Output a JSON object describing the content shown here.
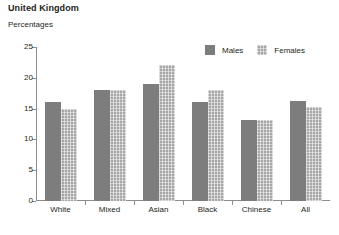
{
  "header": {
    "title": "United Kingdom",
    "subtitle": "Percentages"
  },
  "legend": {
    "position": "top-right",
    "entries": [
      {
        "label": "Males",
        "color": "#7d7d7d",
        "swatch": "males-swatch"
      },
      {
        "label": "Females",
        "color": "#a6a6a6",
        "swatch": "females-swatch"
      }
    ]
  },
  "axis": {
    "y_ticks": [
      "0",
      "5",
      "10",
      "15",
      "20",
      "25"
    ],
    "x_categories": [
      "White",
      "Mixed",
      "Asian",
      "Black",
      "Chinese",
      "All"
    ]
  },
  "chart_data": {
    "type": "bar",
    "title": "United Kingdom",
    "subtitle": "Percentages",
    "xlabel": "",
    "ylabel": "Percentages",
    "ylim": [
      0,
      25
    ],
    "ytick_step": 5,
    "grid": false,
    "legend_position": "top-right",
    "categories": [
      "White",
      "Mixed",
      "Asian",
      "Black",
      "Chinese",
      "All"
    ],
    "series": [
      {
        "name": "Males",
        "color": "#7d7d7d",
        "values": [
          16.0,
          18.0,
          19.0,
          16.0,
          13.2,
          16.3
        ]
      },
      {
        "name": "Females",
        "color": "#a6a6a6",
        "values": [
          15.0,
          18.0,
          22.0,
          18.1,
          13.2,
          15.3
        ]
      }
    ]
  }
}
